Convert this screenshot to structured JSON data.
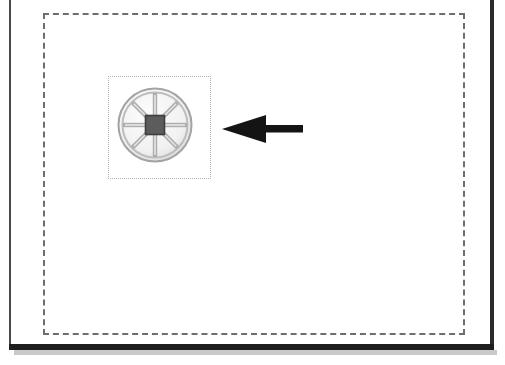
{
  "page": {
    "width": 505,
    "height": 365,
    "background_color": "#ffffff",
    "caption": ""
  },
  "frame": {
    "name": "scanned-page-frame",
    "left_edge_color": "#4a4a4a",
    "right_edge_color": "#2b2b2b",
    "bottom_edge_color": "#1f1f1f",
    "shadow_color": "#c9c9c9"
  },
  "dashed_region": {
    "name": "dashed-boundary",
    "stroke_color": "#6e6e6e",
    "stroke_style": "dashed",
    "stroke_width": 2,
    "x": 43,
    "y": 13,
    "width": 422,
    "height": 322
  },
  "object_selection": {
    "name": "selection-box",
    "stroke_color": "#b0b0b0",
    "stroke_style": "dotted",
    "stroke_width": 1,
    "x": 108,
    "y": 76,
    "width": 103,
    "height": 103
  },
  "wheel": {
    "name": "spoked-wheel-graphic",
    "rim_color": "#9a9a9a",
    "rim_fill": "#f2f2f2",
    "spoke_color": "#a8a8a8",
    "hub_color": "#5c5c5c",
    "hub_border_color": "#3f3f3f",
    "spoke_count": 8,
    "x": 116,
    "y": 86,
    "width": 78,
    "height": 78
  },
  "arrow": {
    "name": "pointer-arrow",
    "direction": "left",
    "color": "#141414",
    "x": 222,
    "y": 112,
    "width": 82,
    "height": 34
  }
}
